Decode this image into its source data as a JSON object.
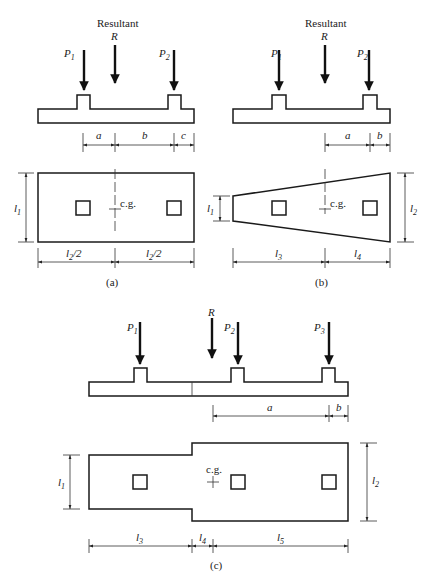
{
  "figure": {
    "panels": [
      {
        "id": "a",
        "caption": "(a)",
        "resultant_label": "Resultant",
        "resultant_symbol": "R",
        "loads": [
          "P1",
          "P2"
        ],
        "top_dims": [
          "a",
          "b",
          "c"
        ],
        "plan_shape": "rectangle",
        "plan_dims": [
          "l2/2",
          "l2/2"
        ],
        "side_dim": "l1",
        "cg_label": "c.g."
      },
      {
        "id": "b",
        "caption": "(b)",
        "resultant_label": "Resultant",
        "resultant_symbol": "R",
        "loads": [
          "P1",
          "P2"
        ],
        "top_dims": [
          "a",
          "b"
        ],
        "plan_shape": "trapezoid",
        "plan_dims": [
          "l3",
          "l4"
        ],
        "side_dims": [
          "l1",
          "l2"
        ],
        "cg_label": "c.g."
      },
      {
        "id": "c",
        "caption": "(c)",
        "resultant_symbol": "R",
        "loads": [
          "P1",
          "P2",
          "P3"
        ],
        "top_dims": [
          "a",
          "b"
        ],
        "plan_shape": "T-shaped / stepped rectangle",
        "plan_dims": [
          "l3",
          "l4",
          "l5"
        ],
        "side_dims": [
          "l1",
          "l2"
        ],
        "cg_label": "c.g."
      }
    ]
  },
  "labels": {
    "resultant": "Resultant",
    "R": "R",
    "P": "P",
    "s1": "1",
    "s2": "2",
    "s3": "3",
    "s4": "4",
    "s5": "5",
    "a": "a",
    "b": "b",
    "c": "c",
    "l": "l",
    "half": "/2",
    "cg": "c.g.",
    "cap_a": "(a)",
    "cap_b": "(b)",
    "cap_c": "(c)"
  }
}
